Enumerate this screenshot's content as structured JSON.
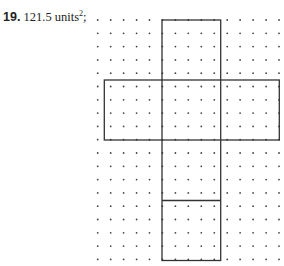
{
  "problem": {
    "number": "19.",
    "answer_value": "121.5 units",
    "answer_exponent": "2",
    "answer_suffix": ";"
  },
  "grid": {
    "origin_x": 97.7,
    "origin_y": 20,
    "spacing_x": 12.95,
    "spacing_y": 13.3,
    "columns": 15,
    "rows": 19,
    "dot_color": "#444444"
  },
  "net": {
    "line_color": "#333333",
    "vertical_strip": {
      "x": 162,
      "y": 20,
      "width": 58.7,
      "height": 240.5
    },
    "horizontal_bar": {
      "x": 104.3,
      "y": 80,
      "width": 175,
      "height": 60
    },
    "divider_y": 200.5,
    "dimensions_units": {
      "strip_width": 4.5,
      "strip_height": 18,
      "bar_width": 13.5,
      "bar_height": 4.5
    }
  }
}
